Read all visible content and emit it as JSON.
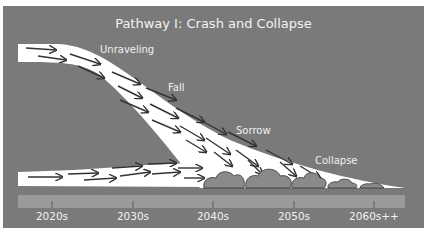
{
  "title": "Pathway I: Crash and Collapse",
  "stages": [
    {
      "label": "Unraveling"
    },
    {
      "label": "Fall"
    },
    {
      "label": "Sorrow"
    },
    {
      "label": "Collapse"
    }
  ],
  "timeline": {
    "ticks": [
      "2020s",
      "2030s",
      "2040s",
      "2050s",
      "2060s++"
    ]
  },
  "colors": {
    "background": "#7a7a7a",
    "pathway": "#ffffff",
    "timeline_bar": "#9a9a9a",
    "text": "#f2f2f2"
  }
}
